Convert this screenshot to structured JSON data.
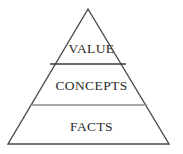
{
  "diagram": {
    "type": "pyramid",
    "title": "",
    "background_color": "#ffffff",
    "outline_color": "#4a4a4a",
    "divider_color_top": "#3a3a3a",
    "divider_color_bottom": "#8c8c8c",
    "text_color": "#2b2b2b",
    "apex": {
      "x": 88,
      "y": 9
    },
    "base_left": {
      "x": 8,
      "y": 144
    },
    "base_right": {
      "x": 169,
      "y": 144
    },
    "tiers": [
      {
        "id": "value",
        "label": "VALUE",
        "level": 1,
        "position": "top",
        "divider_y": 64,
        "divider_x_start": 50,
        "divider_x_end": 126
      },
      {
        "id": "concepts",
        "label": "CONCEPTS",
        "level": 2,
        "position": "middle",
        "divider_y": 105,
        "divider_x_start": 30,
        "divider_x_end": 147
      },
      {
        "id": "facts",
        "label": "FACTS",
        "level": 3,
        "position": "bottom",
        "divider_y": null,
        "divider_x_start": null,
        "divider_x_end": null
      }
    ]
  }
}
